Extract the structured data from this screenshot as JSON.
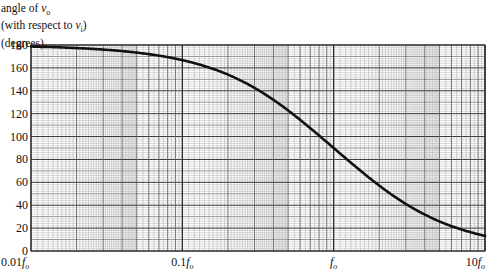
{
  "chart_data": {
    "type": "line",
    "title": "",
    "ylabel_lines": [
      "angle of v_o",
      "(with respect to v_i)",
      "(degrees)"
    ],
    "xlabel": "",
    "x_scale": "log",
    "x_range": [
      0.01,
      10
    ],
    "x_unit": "f_o",
    "xticks": [
      {
        "value": 0.01,
        "label": "0.01f_o"
      },
      {
        "value": 0.1,
        "label": "0.1f_o"
      },
      {
        "value": 1,
        "label": "f_o"
      },
      {
        "value": 10,
        "label": "10f_o"
      }
    ],
    "ylim": [
      0,
      180
    ],
    "yticks": [
      0,
      20,
      40,
      60,
      80,
      100,
      120,
      140,
      160,
      180
    ],
    "grid": true,
    "legend": null,
    "series": [
      {
        "name": "phase of v_o relative to v_i",
        "x": [
          0.01,
          0.02,
          0.05,
          0.1,
          0.2,
          0.3,
          0.5,
          0.7,
          1.0,
          1.5,
          2,
          3,
          5,
          7,
          10
        ],
        "values": [
          178.7,
          177.3,
          173.3,
          166.8,
          152.8,
          141.4,
          118.2,
          103.1,
          90,
          75.6,
          64.2,
          42.5,
          25.3,
          18.3,
          13.2
        ]
      }
    ]
  },
  "labels": {
    "ylabel_1_prefix": "angle of ",
    "ylabel_1_var": "v",
    "ylabel_1_sub": "o",
    "ylabel_2_prefix": "(with respect to ",
    "ylabel_2_var": "v",
    "ylabel_2_sub": "i",
    "ylabel_2_suffix": ")",
    "ylabel_3": "(degrees)"
  }
}
